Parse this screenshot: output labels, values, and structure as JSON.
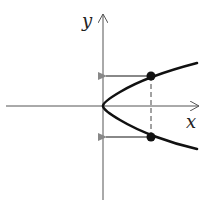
{
  "diagram": {
    "axes": {
      "x_label": "x",
      "y_label": "y"
    },
    "curve": {
      "type": "parabola",
      "equation": "x = y^2",
      "color": "#111111"
    },
    "points": [
      {
        "name": "upper-point",
        "px": [
          151,
          76
        ]
      },
      {
        "name": "lower-point",
        "px": [
          151,
          137
        ]
      }
    ],
    "arrows": {
      "color": "#888888",
      "direction": "left-to-y-axis"
    },
    "dashed_line": {
      "orientation": "vertical",
      "color": "#444444"
    }
  }
}
